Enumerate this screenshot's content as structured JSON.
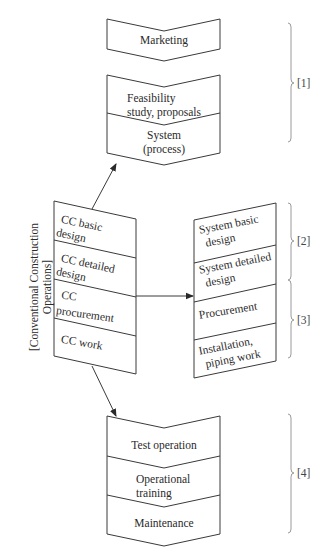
{
  "diagram": {
    "top_block": {
      "marketing": "Marketing",
      "feasibility": [
        "Feasibility",
        "study, proposals"
      ],
      "system": [
        "System",
        "(process)"
      ]
    },
    "cc_column": {
      "side_label": [
        "[Conventional Construction",
        "Operations]"
      ],
      "items": [
        [
          "CC basic",
          "design"
        ],
        [
          "CC detailed",
          "design"
        ],
        [
          "CC",
          "procurement"
        ],
        [
          "CC work"
        ]
      ]
    },
    "system_column": {
      "items": [
        [
          "System basic",
          "design"
        ],
        [
          "System detailed",
          "design"
        ],
        [
          "Procurement"
        ],
        [
          "Installation,",
          "piping work"
        ]
      ]
    },
    "bottom_block": {
      "test_operation": "Test operation",
      "operational_training": [
        "Operational",
        "training"
      ],
      "maintenance": "Maintenance"
    },
    "braces": [
      "[1]",
      "[2]",
      "[3]",
      "[4]"
    ],
    "colors": {
      "stroke": "#3a3a3a",
      "brace": "#9a9a9a",
      "text": "#2a2a2a"
    }
  }
}
